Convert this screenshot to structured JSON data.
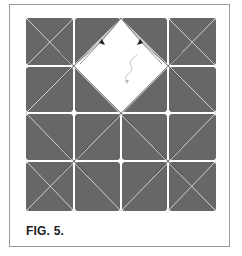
{
  "figure": {
    "caption": "FIG. 5.",
    "colors": {
      "paper_colored": "#676767",
      "paper_white": "#ffffff",
      "crease_light": "#d8d8d8",
      "crease_dark": "#3a3a3a",
      "frame_border": "#9a9a9a"
    },
    "grid": {
      "columns": 4,
      "rows": 4,
      "x_lines": [
        26,
        74,
        121,
        168,
        216
      ],
      "y_lines": [
        18,
        66,
        113,
        161,
        211
      ]
    },
    "white_diamond": {
      "top": [
        121,
        18
      ],
      "right": [
        168,
        66
      ],
      "bottom": [
        121,
        113
      ],
      "left": [
        74,
        66
      ]
    },
    "icons": [
      "fold-arrow-icon",
      "fold-arrow-icon",
      "rotate-arrow-icon"
    ]
  }
}
